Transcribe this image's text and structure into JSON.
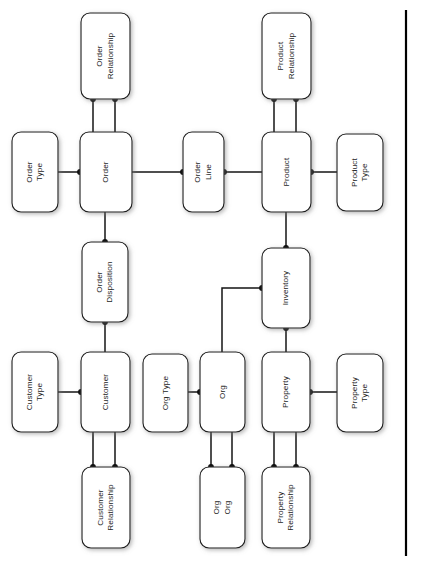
{
  "diagram": {
    "orientation": "rotated-90-ccw",
    "canvas": {
      "width": 425,
      "height": 561
    },
    "colors": {
      "box_fill": "#ffffff",
      "box_stroke": "#1a1a1a",
      "line": "#141414",
      "dot": "#0b0b0b",
      "text": "#1d1d1d",
      "frame_rule": "#000000"
    },
    "entities": [
      {
        "id": "order-relationship",
        "lines": [
          "Order",
          "Relationship"
        ],
        "x": 81,
        "y": 13,
        "w": 49,
        "h": 86
      },
      {
        "id": "product-relationship",
        "lines": [
          "Product",
          "Relationship"
        ],
        "x": 262,
        "y": 13,
        "w": 49,
        "h": 86
      },
      {
        "id": "order-type",
        "lines": [
          "Order",
          "Type"
        ],
        "x": 12,
        "y": 132,
        "w": 46,
        "h": 80
      },
      {
        "id": "order",
        "lines": [
          "Order"
        ],
        "x": 80,
        "y": 132,
        "w": 52,
        "h": 80
      },
      {
        "id": "order-line",
        "lines": [
          "Order",
          "Line"
        ],
        "x": 183,
        "y": 132,
        "w": 41,
        "h": 80
      },
      {
        "id": "product",
        "lines": [
          "Product"
        ],
        "x": 262,
        "y": 132,
        "w": 49,
        "h": 80
      },
      {
        "id": "product-type",
        "lines": [
          "Product",
          "Type"
        ],
        "x": 337,
        "y": 134,
        "w": 46,
        "h": 77
      },
      {
        "id": "order-disposition",
        "lines": [
          "Order",
          "Disposition"
        ],
        "x": 82,
        "y": 242,
        "w": 46,
        "h": 80
      },
      {
        "id": "inventory",
        "lines": [
          "Inventory"
        ],
        "x": 262,
        "y": 248,
        "w": 48,
        "h": 80
      },
      {
        "id": "customer-type",
        "lines": [
          "Customer",
          "Type"
        ],
        "x": 12,
        "y": 352,
        "w": 46,
        "h": 80
      },
      {
        "id": "customer",
        "lines": [
          "Customer"
        ],
        "x": 81,
        "y": 352,
        "w": 49,
        "h": 80
      },
      {
        "id": "org-type",
        "lines": [
          "Org Type"
        ],
        "x": 143,
        "y": 354,
        "w": 45,
        "h": 78
      },
      {
        "id": "org",
        "lines": [
          "Org"
        ],
        "x": 200,
        "y": 352,
        "w": 45,
        "h": 80
      },
      {
        "id": "property",
        "lines": [
          "Property"
        ],
        "x": 262,
        "y": 352,
        "w": 48,
        "h": 80
      },
      {
        "id": "property-type",
        "lines": [
          "Property",
          "Type"
        ],
        "x": 337,
        "y": 354,
        "w": 46,
        "h": 78
      },
      {
        "id": "customer-relationship",
        "lines": [
          "Customer",
          "Relationship"
        ],
        "x": 82,
        "y": 467,
        "w": 48,
        "h": 81
      },
      {
        "id": "org-org",
        "lines": [
          "Org",
          "Org"
        ],
        "x": 200,
        "y": 467,
        "w": 45,
        "h": 81
      },
      {
        "id": "property-relationship",
        "lines": [
          "Property",
          "Relationship"
        ],
        "x": 262,
        "y": 467,
        "w": 48,
        "h": 81
      }
    ],
    "connections": [
      {
        "id": "order-type-to-order",
        "from": "order-type",
        "to": "order",
        "path": "M58,172 L80,172",
        "dots": [
          [
            80,
            172
          ]
        ]
      },
      {
        "id": "order-relationship-to-order-a",
        "from": "order-relationship",
        "to": "order",
        "path": "M93,99 L93,132",
        "dots": [
          [
            93,
            99
          ]
        ]
      },
      {
        "id": "order-relationship-to-order-b",
        "from": "order-relationship",
        "to": "order",
        "path": "M115,99 L115,132",
        "dots": [
          [
            115,
            99
          ]
        ]
      },
      {
        "id": "order-to-order-line",
        "from": "order",
        "to": "order-line",
        "path": "M132,172 L183,172",
        "dots": [
          [
            183,
            172
          ]
        ]
      },
      {
        "id": "order-line-to-product",
        "from": "order-line",
        "to": "product",
        "path": "M224,172 L262,172",
        "dots": [
          [
            224,
            172
          ]
        ]
      },
      {
        "id": "product-relationship-to-product-a",
        "from": "product-relationship",
        "to": "product",
        "path": "M274,99 L274,132",
        "dots": [
          [
            274,
            99
          ]
        ]
      },
      {
        "id": "product-relationship-to-product-b",
        "from": "product-relationship",
        "to": "product",
        "path": "M296,99 L296,132",
        "dots": [
          [
            296,
            99
          ]
        ]
      },
      {
        "id": "product-to-product-type",
        "from": "product",
        "to": "product-type",
        "path": "M311,172 L337,172",
        "dots": [
          [
            311,
            172
          ]
        ]
      },
      {
        "id": "order-to-order-disposition",
        "from": "order",
        "to": "order-disposition",
        "path": "M105,212 L105,242",
        "dots": [
          [
            105,
            242
          ]
        ]
      },
      {
        "id": "order-disposition-to-customer",
        "from": "order-disposition",
        "to": "customer",
        "path": "M105,322 L105,352",
        "dots": [
          [
            105,
            322
          ]
        ]
      },
      {
        "id": "product-to-inventory",
        "from": "product",
        "to": "inventory",
        "path": "M286,212 L286,248",
        "dots": [
          [
            286,
            248
          ]
        ]
      },
      {
        "id": "inventory-to-property",
        "from": "inventory",
        "to": "property",
        "path": "M286,328 L286,352",
        "dots": [
          [
            286,
            328
          ]
        ]
      },
      {
        "id": "org-to-inventory",
        "from": "org",
        "to": "inventory",
        "path": "M222,352 L222,288 L262,288",
        "dots": [
          [
            262,
            288
          ]
        ]
      },
      {
        "id": "customer-type-to-customer",
        "from": "customer-type",
        "to": "customer",
        "path": "M58,392 L81,392",
        "dots": [
          [
            81,
            392
          ]
        ]
      },
      {
        "id": "org-type-to-org",
        "from": "org-type",
        "to": "org",
        "path": "M188,392 L200,392",
        "dots": [
          [
            200,
            392
          ]
        ]
      },
      {
        "id": "property-to-property-type",
        "from": "property",
        "to": "property-type",
        "path": "M310,392 L337,392",
        "dots": [
          [
            310,
            392
          ]
        ]
      },
      {
        "id": "customer-to-customer-relationship-a",
        "from": "customer",
        "to": "customer-relationship",
        "path": "M93,432 L93,467",
        "dots": [
          [
            93,
            467
          ]
        ]
      },
      {
        "id": "customer-to-customer-relationship-b",
        "from": "customer",
        "to": "customer-relationship",
        "path": "M115,432 L115,467",
        "dots": [
          [
            115,
            467
          ]
        ]
      },
      {
        "id": "org-to-org-org-a",
        "from": "org",
        "to": "org-org",
        "path": "M211,432 L211,467",
        "dots": [
          [
            211,
            467
          ]
        ]
      },
      {
        "id": "org-to-org-org-b",
        "from": "org",
        "to": "org-org",
        "path": "M232,432 L232,467",
        "dots": [
          [
            232,
            467
          ]
        ]
      },
      {
        "id": "property-to-property-relationship-a",
        "from": "property",
        "to": "property-relationship",
        "path": "M274,432 L274,467",
        "dots": [
          [
            274,
            467
          ]
        ]
      },
      {
        "id": "property-to-property-relationship-b",
        "from": "property",
        "to": "property-relationship",
        "path": "M296,432 L296,467",
        "dots": [
          [
            296,
            467
          ]
        ]
      }
    ],
    "frame_rule": {
      "x": 406,
      "y1": 10,
      "y2": 556
    }
  }
}
